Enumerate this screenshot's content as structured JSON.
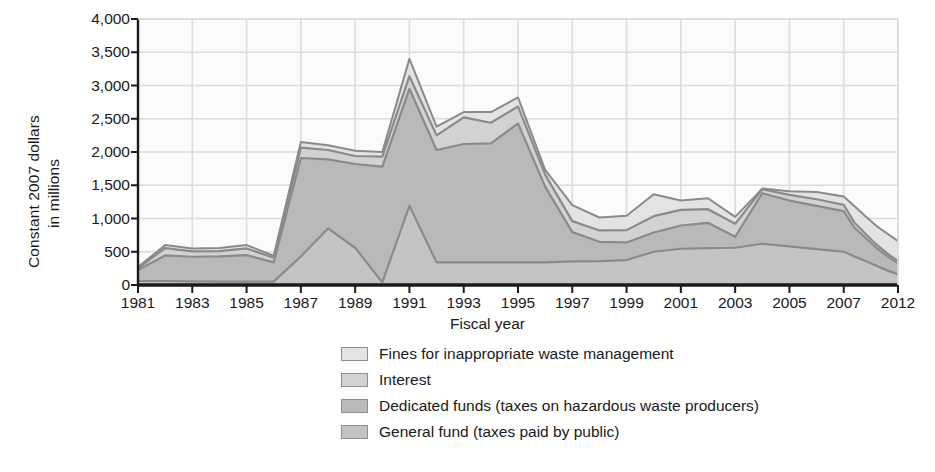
{
  "axes": {
    "ylabel_line1": "Constant 2007 dollars",
    "ylabel_line2": "in millions",
    "xlabel": "Fiscal year"
  },
  "legend": {
    "items": [
      {
        "label": "Fines for inappropriate waste management",
        "color": "#e3e3e3"
      },
      {
        "label": "Interest",
        "color": "#d2d2d2"
      },
      {
        "label": "Dedicated funds (taxes on hazardous waste producers)",
        "color": "#b9b9b9"
      },
      {
        "label": "General fund (taxes paid by public)",
        "color": "#c4c4c4"
      }
    ]
  },
  "style": {
    "plot_bg": "#fbfbfb",
    "grid_color": "#dcdcdc",
    "axis_color": "#1a1a1a",
    "stroke_color": "#8a8a8a",
    "text_color": "#1a1a1a"
  },
  "chart_data": {
    "type": "area",
    "title": "",
    "xlabel": "Fiscal year",
    "ylabel": "Constant 2007 dollars in millions",
    "stacked": true,
    "grid": true,
    "legend_position": "bottom",
    "xlim": [
      1981,
      2012
    ],
    "ylim": [
      0,
      4000
    ],
    "ytick_labels": [
      "0",
      "500",
      "1,000",
      "1,500",
      "2,000",
      "2,500",
      "3,000",
      "3,500",
      "4,000"
    ],
    "ytick_values": [
      0,
      500,
      1000,
      1500,
      2000,
      2500,
      3000,
      3500,
      4000
    ],
    "xtick_labels": [
      "1981",
      "1983",
      "1985",
      "1987",
      "1989",
      "1991",
      "1993",
      "1995",
      "1997",
      "1999",
      "2001",
      "2003",
      "2005",
      "2007",
      "2012"
    ],
    "xtick_values": [
      1981,
      1983,
      1985,
      1987,
      1989,
      1991,
      1993,
      1995,
      1997,
      1999,
      2001,
      2003,
      2005,
      2007,
      2012
    ],
    "x": [
      1981,
      1982,
      1983,
      1984,
      1985,
      1986,
      1987,
      1988,
      1989,
      1990,
      1991,
      1992,
      1993,
      1994,
      1995,
      1996,
      1997,
      1998,
      1999,
      2000,
      2001,
      2002,
      2003,
      2004,
      2005,
      2006,
      2007,
      2008,
      2009,
      2010,
      2011,
      2012
    ],
    "series": [
      {
        "name": "General fund (taxes paid by public)",
        "color": "#c4c4c4",
        "values": [
          60,
          60,
          55,
          50,
          50,
          50,
          430,
          850,
          560,
          40,
          1190,
          340,
          340,
          340,
          340,
          340,
          355,
          360,
          375,
          500,
          545,
          555,
          560,
          620,
          580,
          540,
          500,
          430,
          360,
          290,
          220,
          160
        ]
      },
      {
        "name": "Dedicated funds (taxes on hazardous waste producers)",
        "color": "#b9b9b9",
        "values": [
          165,
          385,
          370,
          380,
          400,
          290,
          1480,
          1040,
          1260,
          1740,
          1760,
          1690,
          1780,
          1790,
          2090,
          1140,
          440,
          290,
          265,
          290,
          350,
          380,
          165,
          760,
          690,
          650,
          610,
          430,
          350,
          270,
          215,
          165
        ]
      },
      {
        "name": "Interest",
        "color": "#d2d2d2",
        "values": [
          30,
          110,
          80,
          80,
          100,
          70,
          155,
          140,
          120,
          150,
          190,
          220,
          400,
          310,
          255,
          180,
          165,
          170,
          185,
          245,
          235,
          205,
          195,
          60,
          85,
          100,
          95,
          75,
          60,
          50,
          40,
          35
        ]
      },
      {
        "name": "Fines for inappropriate waste management",
        "color": "#e3e3e3",
        "values": [
          15,
          45,
          45,
          45,
          50,
          30,
          85,
          70,
          80,
          70,
          260,
          130,
          80,
          160,
          135,
          70,
          240,
          195,
          215,
          330,
          140,
          165,
          105,
          10,
          55,
          110,
          125,
          250,
          265,
          280,
          300,
          300
        ]
      }
    ],
    "totals": [
      270,
      600,
      550,
      555,
      600,
      440,
      2150,
      2100,
      2020,
      2000,
      3400,
      2380,
      2600,
      2600,
      2820,
      1730,
      1200,
      1015,
      1040,
      1365,
      1270,
      1305,
      1025,
      1450,
      1410,
      1400,
      1330,
      1185,
      1035,
      890,
      775,
      660
    ],
    "annotations": []
  }
}
